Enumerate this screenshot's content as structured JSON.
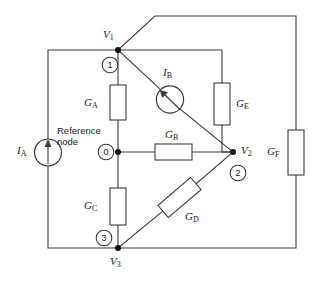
{
  "figure": {
    "background_color": "#ffffff",
    "line_color": "#3c3c3c"
  },
  "annotations": {
    "reference_node_line1": "Reference",
    "reference_node_line2": "node"
  },
  "nodes": [
    {
      "id": "n1",
      "number": "1",
      "voltage_label": "V",
      "voltage_sub": "1",
      "x": 118,
      "y": 50
    },
    {
      "id": "n0",
      "number": "0",
      "voltage_label": "",
      "voltage_sub": "",
      "x": 118,
      "y": 152
    },
    {
      "id": "n2",
      "number": "2",
      "voltage_label": "V",
      "voltage_sub": "2",
      "x": 233,
      "y": 152
    },
    {
      "id": "n3",
      "number": "3",
      "voltage_label": "V",
      "voltage_sub": "3",
      "x": 118,
      "y": 248
    }
  ],
  "conductances": [
    {
      "id": "GA",
      "label": "G",
      "sub": "A",
      "orientation": "vertical"
    },
    {
      "id": "GB",
      "label": "G",
      "sub": "B",
      "orientation": "horizontal"
    },
    {
      "id": "GC",
      "label": "G",
      "sub": "C",
      "orientation": "vertical"
    },
    {
      "id": "GD",
      "label": "G",
      "sub": "D",
      "orientation": "diagonal"
    },
    {
      "id": "GE",
      "label": "G",
      "sub": "E",
      "orientation": "vertical"
    },
    {
      "id": "GF",
      "label": "G",
      "sub": "F",
      "orientation": "vertical"
    }
  ],
  "sources": [
    {
      "id": "IA",
      "label": "I",
      "sub": "A",
      "type": "current-source",
      "orientation": "vertical"
    },
    {
      "id": "IB",
      "label": "I",
      "sub": "B",
      "type": "current-source",
      "orientation": "diagonal"
    }
  ]
}
